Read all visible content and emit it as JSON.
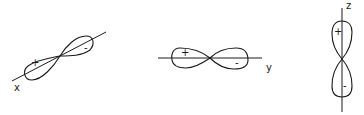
{
  "diagram": {
    "title": "",
    "orbitals": [
      {
        "id": "px",
        "axis_label": "x",
        "positive_sign": "+",
        "negative_sign": "-"
      },
      {
        "id": "py",
        "axis_label": "y",
        "positive_sign": "+",
        "negative_sign": "-"
      },
      {
        "id": "pz",
        "axis_label": "z",
        "positive_sign": "+",
        "negative_sign": "-"
      }
    ]
  },
  "colors": {
    "stroke": "#1a1a1a",
    "background": "#ffffff"
  }
}
